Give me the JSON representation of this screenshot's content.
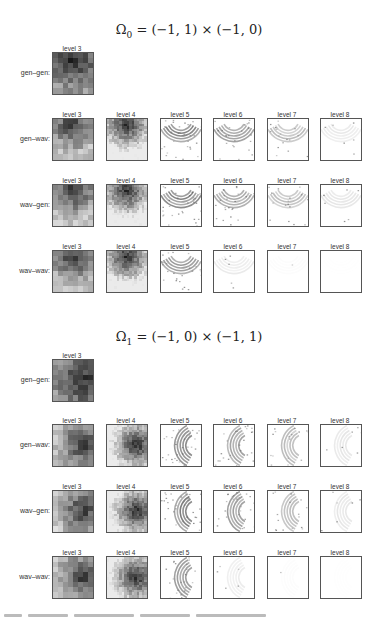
{
  "figure": {
    "sections": [
      {
        "title_symbol": "Ω",
        "title_sub": "0",
        "title_expr": " = (−1, 1) × (−1, 0)",
        "rows": [
          {
            "label": "gen–gen:",
            "levels": [
              "level 3"
            ]
          },
          {
            "label": "gen–wav:",
            "levels": [
              "level 3",
              "level 4",
              "level 5",
              "level 6",
              "level 7",
              "level 8"
            ]
          },
          {
            "label": "wav–gen:",
            "levels": [
              "level 3",
              "level 4",
              "level 5",
              "level 6",
              "level 7",
              "level 8"
            ]
          },
          {
            "label": "wav–wav:",
            "levels": [
              "level 3",
              "level 4",
              "level 5",
              "level 6",
              "level 7",
              "level 8"
            ]
          }
        ]
      },
      {
        "title_symbol": "Ω",
        "title_sub": "1",
        "title_expr": " = (−1, 0) × (−1, 1)",
        "rows": [
          {
            "label": "gen–gen:",
            "levels": [
              "level 3"
            ]
          },
          {
            "label": "gen–wav:",
            "levels": [
              "level 3",
              "level 4",
              "level 5",
              "level 6",
              "level 7",
              "level 8"
            ]
          },
          {
            "label": "wav–gen:",
            "levels": [
              "level 3",
              "level 4",
              "level 5",
              "level 6",
              "level 7",
              "level 8"
            ]
          },
          {
            "label": "wav–wav:",
            "levels": [
              "level 3",
              "level 4",
              "level 5",
              "level 6",
              "level 7",
              "level 8"
            ]
          }
        ]
      }
    ]
  },
  "colors": {
    "background": "#ffffff",
    "panel_border": "#555555",
    "text": "#333333"
  }
}
